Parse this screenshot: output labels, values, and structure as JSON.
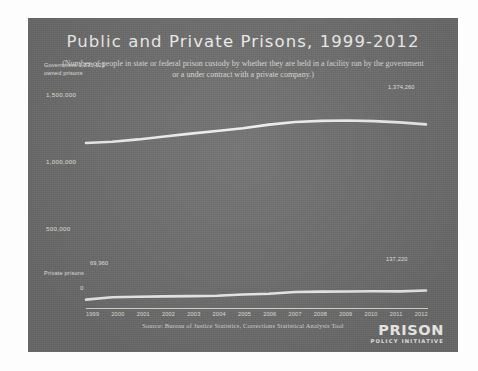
{
  "chart_data": {
    "type": "line",
    "title": "Public and Private Prisons, 1999-2012",
    "subtitle": "(Number of people in state or federal prison custody by whether they are held in a facility run by the government or a under contract with a private company.)",
    "xlabel": "",
    "ylabel": "",
    "categories": [
      "1999",
      "2000",
      "2001",
      "2002",
      "2003",
      "2004",
      "2005",
      "2006",
      "2007",
      "2008",
      "2009",
      "2010",
      "2011",
      "2012"
    ],
    "ylim": [
      0,
      1600000
    ],
    "yticks": [
      "0",
      "500,000",
      "1,000,000",
      "1,500,000"
    ],
    "ytick_values": [
      0,
      500000,
      1000000,
      1500000
    ],
    "grid": false,
    "legend_position": "inline-annotations",
    "series": [
      {
        "name": "Government owned prisons",
        "values": [
          1235121,
          1245000,
          1262000,
          1284000,
          1305000,
          1325000,
          1345000,
          1372000,
          1392000,
          1400000,
          1403000,
          1398000,
          1389000,
          1374260
        ],
        "start_label": "1,235,121",
        "end_label": "1,374,260",
        "color": "#f0eeea"
      },
      {
        "name": "Private prisons",
        "values": [
          69960,
          87000,
          91000,
          94000,
          96000,
          99000,
          108000,
          114000,
          127000,
          129000,
          130000,
          132000,
          131000,
          137220
        ],
        "start_label": "69,960",
        "end_label": "137,220",
        "color": "#f0eeea"
      }
    ],
    "annotations": [
      {
        "id": "gov-series",
        "text": "Government\nowned prisons"
      },
      {
        "id": "private-series",
        "text": "Private prisons"
      }
    ],
    "source": "Source: Bureau of Justice Statistics, Corrections Statistical Analysis Tool"
  },
  "labels": {
    "gov_series_line1": "Government 1,235,121",
    "gov_series_line2": "owned prisons",
    "gov_end": "1,374,260",
    "priv_series": "Private prisons",
    "priv_start": "69,960",
    "priv_end": "137,220"
  },
  "logo": {
    "line1": "PRISON",
    "line2": "POLICY INITIATIVE"
  },
  "colors": {
    "panel_background": "#6f6f6f",
    "line": "#f0eeea",
    "text": "#e9e7e2"
  }
}
